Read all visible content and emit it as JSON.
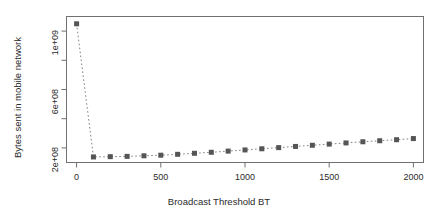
{
  "chart_data": {
    "type": "line",
    "title": "",
    "xlabel": "Broadcast Threshold BT",
    "ylabel": "Bytes sent in mobile network",
    "xlim": [
      -60,
      2060
    ],
    "ylim": [
      100000000,
      1100000000
    ],
    "xticks": [
      0,
      500,
      1000,
      1500,
      2000
    ],
    "xtick_labels": [
      "0",
      "500",
      "1000",
      "1500",
      "2000"
    ],
    "yticks": [
      200000000,
      600000000,
      1000000000
    ],
    "ytick_labels": [
      "2e+08",
      "6e+08",
      "1e+09"
    ],
    "yminor_ticks": [
      400000000,
      800000000
    ],
    "grid": false,
    "legend": null,
    "marker": "filled-square",
    "marker_color": "#555555",
    "line_style": "dotted",
    "line_color": "#808080",
    "x": [
      0,
      100,
      200,
      300,
      400,
      500,
      600,
      700,
      800,
      900,
      1000,
      1100,
      1200,
      1300,
      1400,
      1500,
      1600,
      1700,
      1800,
      1900,
      2000
    ],
    "values": [
      1050000000,
      138000000,
      140000000,
      142000000,
      146000000,
      150000000,
      156000000,
      163000000,
      170000000,
      178000000,
      186000000,
      194000000,
      202000000,
      210000000,
      218000000,
      226000000,
      234000000,
      242000000,
      249000000,
      256000000,
      264000000
    ]
  },
  "axes": {
    "x_title": "Broadcast Threshold BT",
    "y_title": "Bytes sent in mobile network",
    "x_tick_labels": [
      "0",
      "500",
      "1000",
      "1500",
      "2000"
    ],
    "y_tick_labels": [
      "2e+08",
      "6e+08",
      "1e+09"
    ]
  }
}
